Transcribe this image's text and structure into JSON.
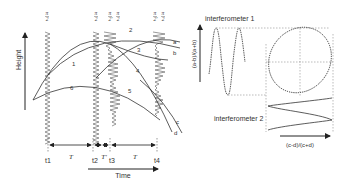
{
  "left_panel": {
    "y_axis_label": "Height",
    "x_axis_label": "Time",
    "pulse_labels": [
      {
        "x": 47,
        "text_num": "π",
        "text_den": "2"
      },
      {
        "x": 96,
        "text_num": "π",
        "text_den": "2"
      },
      {
        "x": 110,
        "text_num": "π",
        "text_den": "2'"
      },
      {
        "x": 118,
        "text_num": "π",
        "text_den": "2"
      },
      {
        "x": 155,
        "text_num": "π",
        "text_den": "2'"
      },
      {
        "x": 163,
        "text_num": "π",
        "text_den": "2"
      }
    ],
    "trajectory_labels": [
      "1",
      "2",
      "3",
      "4",
      "5",
      "6"
    ],
    "port_labels": [
      "a",
      "b",
      "c",
      "d"
    ],
    "time_labels": [
      "t1",
      "t2",
      "t3",
      "t4"
    ],
    "interval_labels": [
      "T",
      "T'",
      "T"
    ]
  },
  "right_panel": {
    "interferometer_1_label": "interferometer 1",
    "interferometer_2_label": "interferometer 2",
    "y_axis_label": "(a-b)/(a+b)",
    "x_axis_label": "(c-d)/(c+d)"
  }
}
